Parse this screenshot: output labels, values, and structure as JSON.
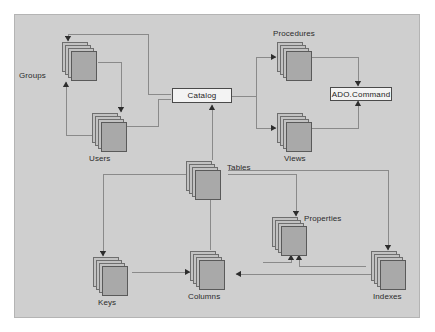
{
  "diagram": {
    "background_color": "#cfcfcf",
    "frame_border_color": "#b4b4b4",
    "line_color": "#8a8a8a",
    "sheet_fill": "#c2c2c2",
    "sheet_front_fill": "#a9a9a9",
    "sheet_border": "#6e6e6e",
    "box_fill": "#f3f3f3",
    "box_border": "#4a4a4a",
    "nodes": [
      {
        "id": "groups",
        "label": "Groups",
        "type": "collection"
      },
      {
        "id": "users",
        "label": "Users",
        "type": "collection"
      },
      {
        "id": "catalog",
        "label": "Catalog",
        "type": "object"
      },
      {
        "id": "procedures",
        "label": "Procedures",
        "type": "collection"
      },
      {
        "id": "views",
        "label": "Views",
        "type": "collection"
      },
      {
        "id": "adocommand",
        "label": "ADO.Command",
        "type": "object"
      },
      {
        "id": "tables",
        "label": "Tables",
        "type": "collection"
      },
      {
        "id": "properties",
        "label": "Properties",
        "type": "collection"
      },
      {
        "id": "keys",
        "label": "Keys",
        "type": "collection"
      },
      {
        "id": "columns",
        "label": "Columns",
        "type": "collection"
      },
      {
        "id": "indexes",
        "label": "Indexes",
        "type": "collection"
      }
    ],
    "edges": [
      {
        "from": "catalog",
        "to": "groups"
      },
      {
        "from": "catalog",
        "to": "users"
      },
      {
        "from": "groups",
        "to": "users"
      },
      {
        "from": "users",
        "to": "groups"
      },
      {
        "from": "catalog",
        "to": "procedures"
      },
      {
        "from": "catalog",
        "to": "views"
      },
      {
        "from": "procedures",
        "to": "adocommand"
      },
      {
        "from": "views",
        "to": "adocommand"
      },
      {
        "from": "tables",
        "to": "catalog"
      },
      {
        "from": "tables",
        "to": "keys"
      },
      {
        "from": "tables",
        "to": "columns"
      },
      {
        "from": "tables",
        "to": "properties"
      },
      {
        "from": "tables",
        "to": "indexes"
      },
      {
        "from": "keys",
        "to": "columns"
      },
      {
        "from": "indexes",
        "to": "columns"
      },
      {
        "from": "columns",
        "to": "properties"
      },
      {
        "from": "indexes",
        "to": "properties"
      }
    ]
  }
}
